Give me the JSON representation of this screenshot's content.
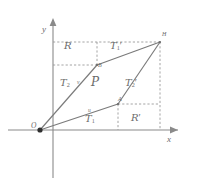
{
  "figure": {
    "kind": "geometry-diagram",
    "colors": {
      "axis": "#8a8a8a",
      "solid_line": "#7a7a7a",
      "dashed_line": "#9a9a9a",
      "label": "#6b6b6b",
      "point": "#3a3a3a",
      "background": "#ffffff"
    },
    "axes": {
      "x_label": "x",
      "y_label": "y",
      "origin_label": "O"
    },
    "points": [
      {
        "id": "O",
        "label": "O",
        "x": 40,
        "y": 130
      },
      {
        "id": "A",
        "label": "A",
        "x": 118,
        "y": 104
      },
      {
        "id": "B",
        "label": "B",
        "x": 97,
        "y": 65
      },
      {
        "id": "H",
        "label": "H",
        "x": 160,
        "y": 42
      }
    ],
    "vectors": [
      {
        "id": "u",
        "label": "u",
        "from": "O",
        "to": "A"
      },
      {
        "id": "v",
        "label": "v",
        "from": "O",
        "to": "B"
      }
    ],
    "regions": [
      {
        "id": "R",
        "base": "R",
        "prime": "",
        "x": 70,
        "y": 47
      },
      {
        "id": "T1p",
        "base": "T",
        "sub": "1",
        "prime": "′",
        "x": 116,
        "y": 47
      },
      {
        "id": "T2",
        "base": "T",
        "sub": "2",
        "prime": "",
        "x": 66,
        "y": 84
      },
      {
        "id": "P",
        "base": "P",
        "prime": "",
        "x": 96,
        "y": 83
      },
      {
        "id": "T2p",
        "base": "T",
        "sub": "2",
        "prime": "′",
        "x": 130,
        "y": 84
      },
      {
        "id": "T1",
        "base": "T",
        "sub": "1",
        "prime": "",
        "x": 90,
        "y": 120
      },
      {
        "id": "Rp",
        "base": "R",
        "prime": "′",
        "x": 136,
        "y": 119
      }
    ]
  }
}
